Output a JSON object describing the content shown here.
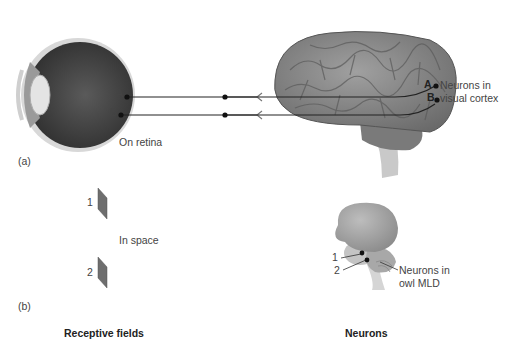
{
  "figure": {
    "panel_a": {
      "label": "(a)",
      "eye": {
        "point_a": "A",
        "point_b": "B",
        "caption": "On retina"
      },
      "brain": {
        "point_a": "A",
        "point_b": "B",
        "caption_line1": "Neurons in",
        "caption_line2": "visual cortex"
      }
    },
    "panel_b": {
      "label": "(b)",
      "fields": {
        "field_1": "1",
        "field_2": "2",
        "caption": "In space"
      },
      "owl_brain": {
        "point_1": "1",
        "point_2": "2",
        "caption_line1": "Neurons in",
        "caption_line2": "owl MLD"
      }
    },
    "column_headers": {
      "left": "Receptive fields",
      "right": "Neurons"
    },
    "colors": {
      "eye_dark": "#3a3a3a",
      "brain_gray": "#8a8a8a",
      "field_gray": "#6e6e6e",
      "line": "#222222"
    }
  }
}
